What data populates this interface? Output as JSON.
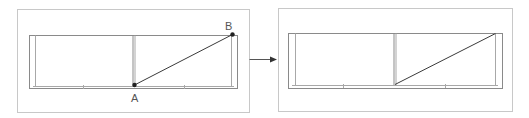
{
  "diagram": {
    "before_panel": {
      "points": [
        {
          "label": "A",
          "x": 134,
          "y": 85
        },
        {
          "label": "B",
          "x": 232,
          "y": 34
        }
      ]
    },
    "arrow": {
      "direction": "right"
    },
    "after_panel": {
      "line": {
        "from": [
          395,
          84
        ],
        "to": [
          495,
          34
        ]
      }
    },
    "colors": {
      "frame": "#c8c8c8",
      "cabinet": "#8a8a8a",
      "line": "#3a3a3a",
      "point": "#222222"
    }
  }
}
